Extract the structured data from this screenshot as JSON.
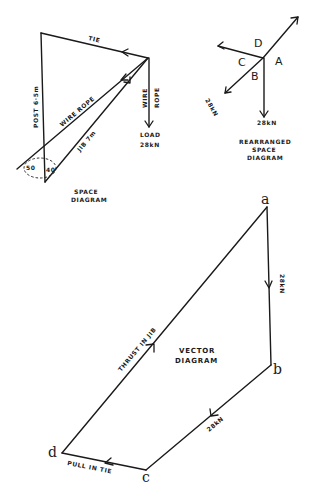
{
  "space_diagram": {
    "title_line1": "SPACE",
    "title_line2": "DIAGRAM",
    "tie_label": "TIE",
    "post_label": "POST 6·5m",
    "wire_rope_label": "WIRE ROPE",
    "jib_label": "JIB  7m",
    "vertical_wire_line1": "WIRE",
    "vertical_wire_line2": "ROPE",
    "load_line1": "LOAD",
    "load_line2": "28kN",
    "angle1": "50",
    "angle2": "40"
  },
  "rearranged_diagram": {
    "title_line1": "REARRANGED",
    "title_line2": "SPACE",
    "title_line3": "DIAGRAM",
    "label_a": "A",
    "label_b": "B",
    "label_c": "C",
    "label_d": "D",
    "force_left": "28kN",
    "force_down": "28kN"
  },
  "vector_diagram": {
    "title_line1": "VECTOR",
    "title_line2": "DIAGRAM",
    "point_a": "a",
    "point_b": "b",
    "point_c": "c",
    "point_d": "d",
    "ab_label": "28kN",
    "bc_label": "28kN",
    "cd_label": "PULL IN TIE",
    "da_label": "THRUST IN JIB"
  }
}
